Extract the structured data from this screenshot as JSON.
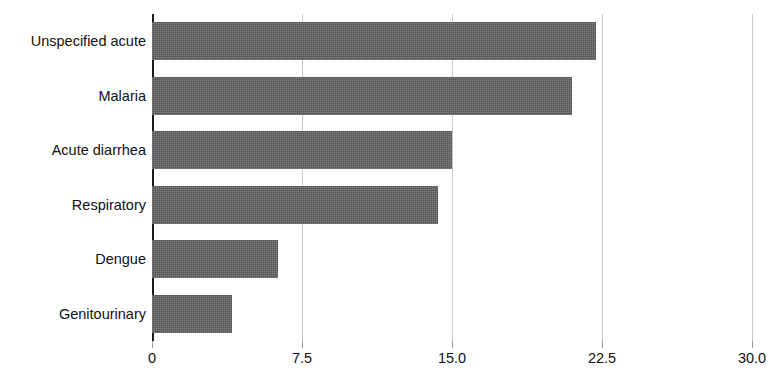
{
  "figure": {
    "title_sliver": "",
    "bar_color": "#5e5e5e",
    "gridline_color": "#c9c9c9",
    "axis_color": "#1a1a1a",
    "text_color": "#111111"
  },
  "chart_data": {
    "type": "bar",
    "orientation": "horizontal",
    "title": "",
    "xlabel": "",
    "ylabel": "",
    "categories": [
      "Unspecified acute",
      "Malaria",
      "Acute diarrhea",
      "Respiratory",
      "Dengue",
      "Genitourinary"
    ],
    "values": [
      22.2,
      21.0,
      15.0,
      14.3,
      6.3,
      4.0
    ],
    "xlim": [
      0,
      30
    ],
    "ylim": [
      0,
      6
    ],
    "xticks": [
      0,
      7.5,
      15,
      22.5,
      30
    ],
    "xticklabels": [
      "0",
      "7.5",
      "15.0",
      "22.5",
      "30.0"
    ],
    "grid": "vertical",
    "legend": null,
    "series": [
      {
        "name": "",
        "values": [
          22.2,
          21.0,
          15.0,
          14.3,
          6.3,
          4.0
        ]
      }
    ]
  }
}
